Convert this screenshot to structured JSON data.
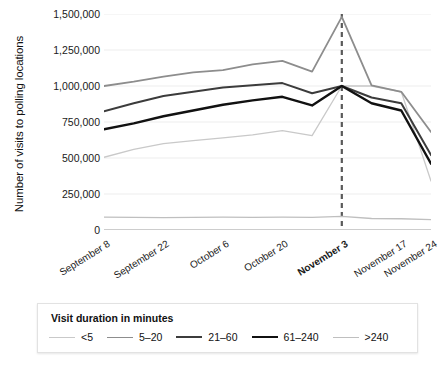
{
  "chart_data": {
    "type": "line",
    "title": "",
    "xlabel": "",
    "ylabel": "Number of visits to polling locations",
    "ylim": [
      0,
      1500000
    ],
    "yticks": [
      0,
      250000,
      500000,
      750000,
      1000000,
      1250000,
      1500000
    ],
    "ytick_labels": [
      "0",
      "250,000",
      "500,000",
      "750,000",
      "1,000,000",
      "1,250,000",
      "1,500,000"
    ],
    "grid": true,
    "legend_position": "bottom",
    "legend_title": "Visit duration in minutes",
    "x": [
      "September 8",
      "September 15",
      "September 22",
      "September 29",
      "October 6",
      "October 13",
      "October 20",
      "October 27",
      "November 3",
      "November 10",
      "November 17",
      "November 24"
    ],
    "xtick_labels": [
      "September 8",
      "September 22",
      "October 6",
      "October 20",
      "November 3",
      "November 17",
      "November 24"
    ],
    "xtick_bold": [
      "November 3"
    ],
    "annotation": {
      "type": "vertical-dashed-line",
      "at": "November 3",
      "label": "November 3"
    },
    "categories": [
      "September 8",
      "September 15",
      "September 22",
      "September 29",
      "October 6",
      "October 13",
      "October 20",
      "October 27",
      "November 3",
      "November 10",
      "November 17",
      "November 24"
    ],
    "series": [
      {
        "name": "<5",
        "color": "#c9c9c9",
        "width": 1.3,
        "values": [
          505000,
          560000,
          600000,
          620000,
          640000,
          660000,
          690000,
          655000,
          1000000,
          1000000,
          960000,
          340000
        ]
      },
      {
        "name": "5–20",
        "color": "#8d8d8d",
        "width": 1.8,
        "values": [
          1000000,
          1030000,
          1065000,
          1095000,
          1110000,
          1150000,
          1175000,
          1100000,
          1480000,
          1005000,
          960000,
          680000
        ]
      },
      {
        "name": "21–60",
        "color": "#3c3c3c",
        "width": 2.0,
        "values": [
          825000,
          880000,
          930000,
          960000,
          990000,
          1005000,
          1020000,
          950000,
          1000000,
          920000,
          880000,
          520000
        ]
      },
      {
        "name": "61–240",
        "color": "#111111",
        "width": 2.4,
        "values": [
          700000,
          740000,
          790000,
          830000,
          870000,
          900000,
          925000,
          865000,
          1000000,
          880000,
          830000,
          460000
        ]
      },
      {
        "name": ">240",
        "color": "#bfbfbf",
        "width": 1.3,
        "values": [
          90000,
          88000,
          86000,
          88000,
          90000,
          88000,
          90000,
          88000,
          95000,
          80000,
          78000,
          72000
        ]
      }
    ]
  },
  "legend": {
    "title": "Visit duration in minutes",
    "items": [
      {
        "label": "<5"
      },
      {
        "label": "5–20"
      },
      {
        "label": "21–60"
      },
      {
        "label": "61–240"
      },
      {
        "label": ">240"
      }
    ]
  }
}
